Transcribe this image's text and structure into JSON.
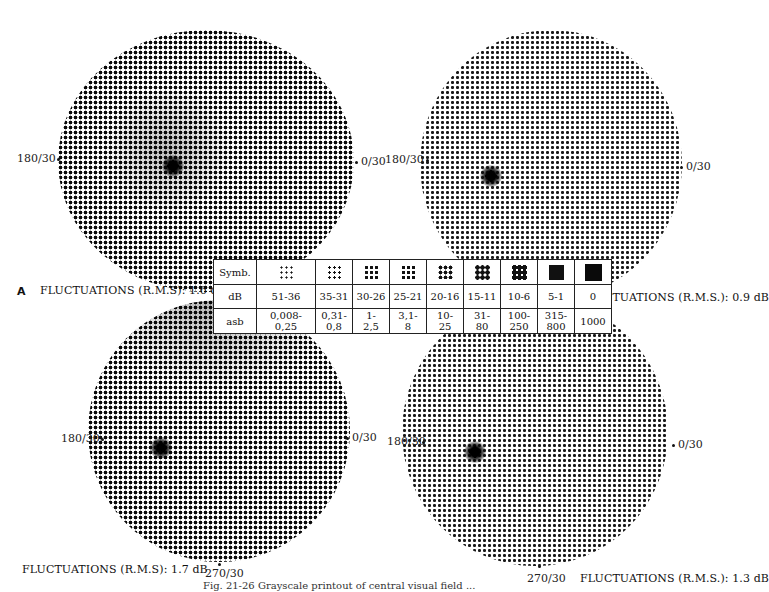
{
  "figure": {
    "panel_letter": "A",
    "caption_partial": "Fig. 21-26   Grayscale printout of central visual field ...",
    "fields": [
      {
        "id": "top-left",
        "left_label": "180/30",
        "right_label": "0/30",
        "bottom_label": "",
        "fluctuations": "FLUCTUATIONS (R.M.S): 1.6 dB"
      },
      {
        "id": "top-right",
        "left_label": "180/30",
        "right_label": "0/30",
        "bottom_label": "",
        "fluctuations": "FLUCTUATIONS (R.M.S.): 0.9 dB"
      },
      {
        "id": "bottom-left",
        "left_label": "180/30",
        "right_label": "0/30",
        "bottom_label": "270/30",
        "fluctuations": "FLUCTUATIONS (R.M.S): 1.7 dB"
      },
      {
        "id": "bottom-right",
        "left_label": "180/30",
        "right_label": "0/30",
        "bottom_label": "270/30",
        "fluctuations": "FLUCTUATIONS (R.M.S.): 1.3 dB"
      }
    ]
  },
  "legend": {
    "row_labels": [
      "Symb.",
      "dB",
      "asb"
    ],
    "db": [
      "51-36",
      "35-31",
      "30-26",
      "25-21",
      "20-16",
      "15-11",
      "10-6",
      "5-1",
      "0"
    ],
    "asb": [
      [
        "0,008-",
        "0,25"
      ],
      [
        "0,31-",
        "0,8"
      ],
      [
        "1-",
        "2,5"
      ],
      [
        "3,1-",
        "8"
      ],
      [
        "10-",
        "25"
      ],
      [
        "31-",
        "80"
      ],
      [
        "100-",
        "250"
      ],
      [
        "315-",
        "800"
      ],
      [
        "1000",
        ""
      ]
    ],
    "symbol_density": [
      1,
      2,
      3,
      4,
      5,
      6,
      7,
      8,
      9
    ]
  }
}
